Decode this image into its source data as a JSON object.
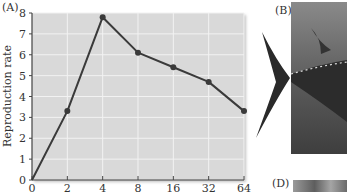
{
  "panels": {
    "a_label": "(A)",
    "b_label": "(B)",
    "d_label": "(D)"
  },
  "chart_data": {
    "type": "line",
    "title": "",
    "xlabel": "",
    "ylabel": "Reproduction rate",
    "x": [
      0,
      2,
      4,
      8,
      16,
      32,
      64
    ],
    "categories": [
      "0",
      "2",
      "4",
      "8",
      "16",
      "32",
      "64"
    ],
    "values": [
      0,
      3.3,
      7.8,
      6.1,
      5.4,
      4.7,
      3.3
    ],
    "ylim": [
      0,
      8
    ],
    "yticks": [
      0,
      1,
      2,
      3,
      4,
      5,
      6,
      7,
      8
    ],
    "grid": true,
    "legend": null,
    "x_scale": "categorical (log2-like spacing)",
    "colors": {
      "plot_bg": "#d9d9d9",
      "grid": "#f2f2f2",
      "line": "#3a3a3a",
      "marker": "#3a3a3a"
    }
  },
  "photos": {
    "b": {
      "description": "tuna tail fin photograph",
      "tone": "grayscale"
    },
    "d": {
      "description": "partial photograph",
      "tone": "grayscale"
    }
  }
}
